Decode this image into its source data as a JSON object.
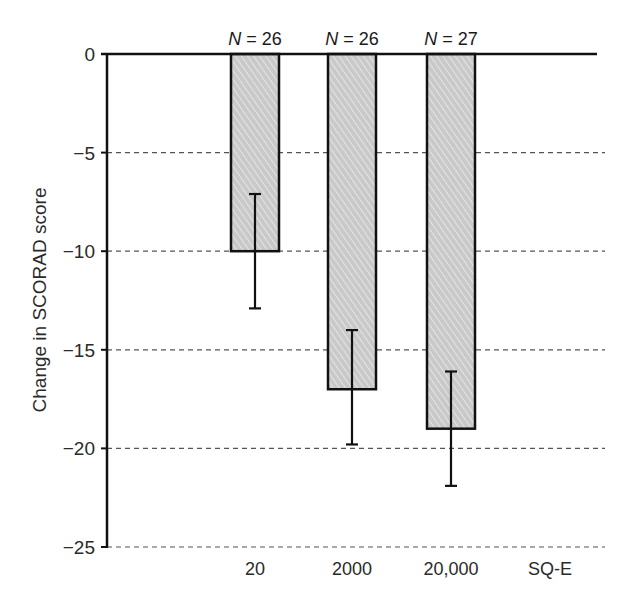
{
  "chart_data": {
    "type": "bar",
    "title": "",
    "xlabel": "",
    "ylabel": "Change in SCORAD score",
    "categories": [
      "20",
      "2000",
      "20,000",
      "SQ-E"
    ],
    "values": [
      -10,
      -17,
      -19,
      null
    ],
    "error_bars": [
      {
        "lower": -12.9,
        "upper": -7.1
      },
      {
        "lower": -19.8,
        "upper": -14.0
      },
      {
        "lower": -21.9,
        "upper": -16.1
      },
      null
    ],
    "annotations": [
      "N = 26",
      "N = 26",
      "N = 27",
      ""
    ],
    "yticks": [
      0,
      -5,
      -10,
      -15,
      -20,
      -25
    ],
    "ytick_labels": [
      "0",
      "−5",
      "−10",
      "−15",
      "−20",
      "−25"
    ],
    "ylim": [
      -25,
      0
    ],
    "grid": "horizontal dashed",
    "legend": null,
    "colors": {
      "bar_fill": "#c9c9c9",
      "bar_hatch": "#eeeeee",
      "stroke": "#111111",
      "grid": "#555555"
    }
  }
}
